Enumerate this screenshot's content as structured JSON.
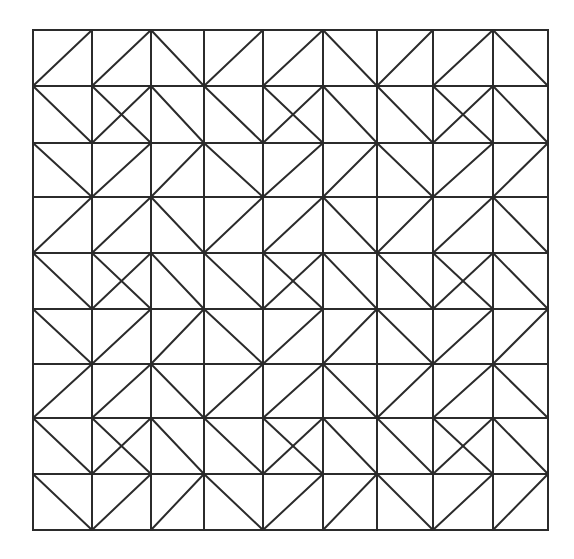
{
  "figure": {
    "type": "triangle-tiling-grid",
    "rows": 9,
    "cols": 9,
    "line_color": "#2b2b2b",
    "background": "#ffffff",
    "col_edges": [
      33,
      92,
      151,
      204,
      263,
      323,
      377,
      433,
      493,
      548
    ],
    "row_edges": [
      30,
      86,
      143,
      197,
      253,
      309,
      364,
      418,
      474,
      530
    ],
    "legend": {
      "/": "diagonal bottom-left to top-right",
      "\\": "diagonal top-left to bottom-right",
      "X": "both diagonals"
    },
    "cells": [
      [
        "/",
        "/",
        "\\",
        "/",
        "/",
        "\\",
        "/",
        "/",
        "\\"
      ],
      [
        "\\",
        "X",
        "\\",
        "\\",
        "X",
        "\\",
        "\\",
        "X",
        "\\"
      ],
      [
        "\\",
        "/",
        "/",
        "\\",
        "/",
        "/",
        "\\",
        "/",
        "/"
      ],
      [
        "/",
        "/",
        "\\",
        "/",
        "/",
        "\\",
        "/",
        "/",
        "\\"
      ],
      [
        "\\",
        "X",
        "\\",
        "\\",
        "X",
        "\\",
        "\\",
        "X",
        "\\"
      ],
      [
        "\\",
        "/",
        "/",
        "\\",
        "/",
        "/",
        "\\",
        "/",
        "/"
      ],
      [
        "/",
        "/",
        "\\",
        "/",
        "/",
        "\\",
        "/",
        "/",
        "\\"
      ],
      [
        "\\",
        "X",
        "\\",
        "\\",
        "X",
        "\\",
        "\\",
        "X",
        "\\"
      ],
      [
        "\\",
        "/",
        "/",
        "\\",
        "/",
        "/",
        "\\",
        "/",
        "/"
      ]
    ]
  }
}
